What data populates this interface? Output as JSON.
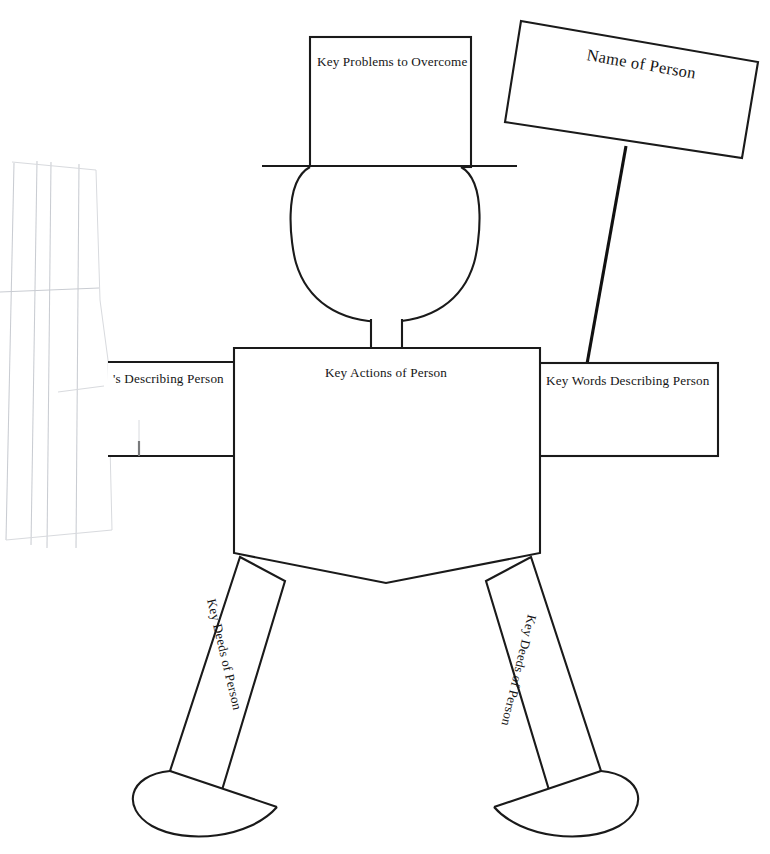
{
  "document": {
    "title": "Body Biography Graphic Organizer",
    "background_color": "#ffffff",
    "ink_color": "#1a1a1a",
    "ghost_color": "#c9ccd2",
    "width": 770,
    "height": 854
  },
  "figure": {
    "hat": {
      "label": "Key Problems to Overcome",
      "shape": "rectangle-hat-crown"
    },
    "hat_brim": {
      "label": "",
      "shape": "horizontal-line"
    },
    "head": {
      "label": "",
      "shape": "circle"
    },
    "neck": {
      "label": "",
      "shape": "rectangle"
    },
    "sign": {
      "label": "Name of Person",
      "shape": "tilted-rectangle-placard"
    },
    "sign_pole": {
      "label": "",
      "shape": "line"
    },
    "left_arm": {
      "label": "'s Describing Person",
      "full_label": "Key Words Describing Person",
      "shape": "rectangle-cropped-at-page-edge"
    },
    "right_arm": {
      "label": "Key Words Describing Person",
      "shape": "rectangle"
    },
    "torso": {
      "label": "Key Actions of Person",
      "shape": "pentagon-pointed-bottom"
    },
    "left_leg": {
      "label": "Key Deeds of Person",
      "shape": "rotated-rectangle"
    },
    "right_leg": {
      "label": "Key Deeds of Person",
      "shape": "rotated-rectangle"
    },
    "left_foot": {
      "label": "",
      "shape": "half-ellipse"
    },
    "right_foot": {
      "label": "",
      "shape": "half-ellipse"
    }
  },
  "artifacts": {
    "scan_ghost_lines": {
      "description": "faint gray ruled lines bleeding through at left edge"
    }
  }
}
